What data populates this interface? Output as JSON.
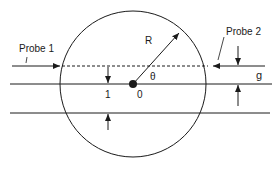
{
  "diagram": {
    "labels": {
      "probe1": "Probe 1",
      "probe2": "Probe 2",
      "radius": "R",
      "angle": "θ",
      "center": "0",
      "gap_left": "1",
      "gap_right": "g"
    },
    "colors": {
      "stroke": "#1a1a1a",
      "background": "#ffffff"
    }
  }
}
